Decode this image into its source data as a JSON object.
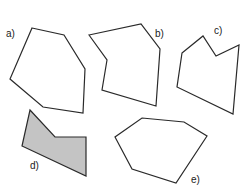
{
  "figure": {
    "background": "#ffffff",
    "stroke_color": "#2a2a2a",
    "fill_color": "#c4c4c4",
    "shapes": [
      {
        "id": "a",
        "label": "a)",
        "label_pos": [
          6,
          37
        ],
        "filled": false,
        "points": "32,28 64,35 85,69 83,113 43,107 10,79"
      },
      {
        "id": "b",
        "label": "b)",
        "label_pos": [
          155,
          37
        ],
        "filled": false,
        "points": "89,35 141,24 160,49 156,106 102,90 107,60"
      },
      {
        "id": "c",
        "label": "c)",
        "label_pos": [
          214,
          34
        ],
        "filled": false,
        "points": "182,53 203,36 216,56 239,45 233,114 177,87"
      },
      {
        "id": "d",
        "label": "d)",
        "label_pos": [
          30,
          169
        ],
        "filled": true,
        "points": "30,110 55,137 86,137 86,176 22,146"
      },
      {
        "id": "e",
        "label": "e)",
        "label_pos": [
          191,
          183
        ],
        "filled": false,
        "points": "142,118 184,122 207,136 176,183 132,169 115,137"
      }
    ]
  }
}
